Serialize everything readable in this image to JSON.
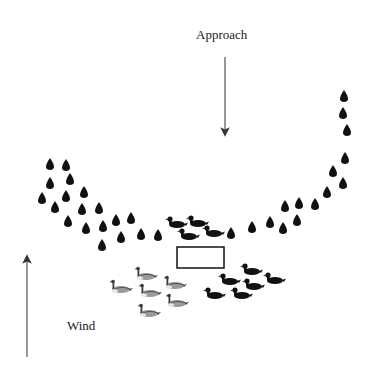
{
  "diagram": {
    "labels": {
      "approach": "Approach",
      "wind": "Wind"
    },
    "colors": {
      "ink": "#111111",
      "arrow": "#555555",
      "goose_body": "#9a9a9a",
      "goose_dark": "#3a3a3a"
    },
    "approach_arrow": {
      "x": 225,
      "y1": 57,
      "y2": 132,
      "direction": "down"
    },
    "wind_arrow": {
      "x": 27,
      "y1": 259,
      "y2": 357,
      "direction": "up"
    },
    "blind_rectangle": {
      "x": 177,
      "y": 247,
      "width": 47,
      "height": 21
    },
    "teardrop_decoys": [
      [
        50,
        165
      ],
      [
        66,
        166
      ],
      [
        70,
        180
      ],
      [
        50,
        184
      ],
      [
        42,
        199
      ],
      [
        66,
        197
      ],
      [
        55,
        208
      ],
      [
        84,
        193
      ],
      [
        82,
        210
      ],
      [
        99,
        209
      ],
      [
        68,
        222
      ],
      [
        86,
        229
      ],
      [
        103,
        227
      ],
      [
        116,
        221
      ],
      [
        131,
        219
      ],
      [
        121,
        238
      ],
      [
        141,
        235
      ],
      [
        158,
        236
      ],
      [
        102,
        246
      ],
      [
        231,
        234
      ],
      [
        252,
        228
      ],
      [
        270,
        223
      ],
      [
        283,
        229
      ],
      [
        285,
        207
      ],
      [
        297,
        221
      ],
      [
        299,
        204
      ],
      [
        315,
        205
      ],
      [
        327,
        193
      ],
      [
        343,
        184
      ],
      [
        333,
        172
      ],
      [
        345,
        159
      ],
      [
        347,
        131
      ],
      [
        343,
        114
      ],
      [
        344,
        97
      ]
    ],
    "black_ducks": [
      [
        175,
        223
      ],
      [
        196,
        222
      ],
      [
        187,
        235
      ],
      [
        212,
        232
      ],
      [
        250,
        270
      ],
      [
        228,
        280
      ],
      [
        273,
        279
      ],
      [
        252,
        285
      ],
      [
        213,
        294
      ],
      [
        240,
        294
      ]
    ],
    "goose_decoys": [
      [
        144,
        275
      ],
      [
        119,
        288
      ],
      [
        148,
        292
      ],
      [
        173,
        284
      ],
      [
        175,
        302
      ],
      [
        147,
        312
      ]
    ]
  }
}
